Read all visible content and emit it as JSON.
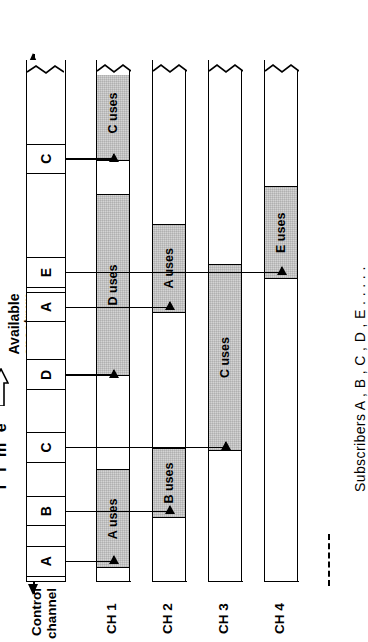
{
  "figure": {
    "axis_time_label": "T i m e",
    "axis_spectrum_label_line1": "Available",
    "axis_spectrum_label_line2": "spectrum",
    "subscribers_caption": "Subscribers A , B , C , D , E . . . . .",
    "time_arrow_icon": "hollow-up-arrow-icon",
    "spectrum_arrow_icon": "double-headed-arrow-icon"
  },
  "control_channel": {
    "label_line1": "Control",
    "label_line2": "channel",
    "slots": [
      {
        "id": "slot-a1",
        "label": "A",
        "start_pct": 0.8,
        "width_pct": 6.0
      },
      {
        "id": "slot-b",
        "label": "B",
        "start_pct": 10.6,
        "width_pct": 5.6
      },
      {
        "id": "slot-c1",
        "label": "C",
        "start_pct": 22.6,
        "width_pct": 6.0
      },
      {
        "id": "slot-d",
        "label": "D",
        "start_pct": 36.5,
        "width_pct": 6.0
      },
      {
        "id": "slot-a2",
        "label": "A",
        "start_pct": 49.6,
        "width_pct": 5.8
      },
      {
        "id": "slot-e",
        "label": "E",
        "start_pct": 56.2,
        "width_pct": 5.8
      },
      {
        "id": "slot-c2",
        "label": "C",
        "start_pct": 78.0,
        "width_pct": 5.8
      }
    ]
  },
  "channels": [
    {
      "id": "ch1",
      "label": "CH 1",
      "blocks": [
        {
          "id": "ch1-a",
          "label": "A uses",
          "start_pct": 2.6,
          "width_pct": 19.0
        },
        {
          "id": "ch1-d",
          "label": "D uses",
          "start_pct": 39.4,
          "width_pct": 35.0
        },
        {
          "id": "ch1-c",
          "label": "C uses",
          "start_pct": 80.6,
          "width_pct": 18.5
        }
      ]
    },
    {
      "id": "ch2",
      "label": "CH 2",
      "blocks": [
        {
          "id": "ch2-b",
          "label": "B uses",
          "start_pct": 12.2,
          "width_pct": 13.5
        },
        {
          "id": "ch2-a",
          "label": "A uses",
          "start_pct": 51.6,
          "width_pct": 17.0
        }
      ]
    },
    {
      "id": "ch3",
      "label": "CH 3",
      "blocks": [
        {
          "id": "ch3-c",
          "label": "C uses",
          "start_pct": 25.0,
          "width_pct": 36.0
        }
      ]
    },
    {
      "id": "ch4",
      "label": "CH 4",
      "blocks": [
        {
          "id": "ch4-e",
          "label": "E uses",
          "start_pct": 58.0,
          "width_pct": 17.8
        }
      ]
    }
  ],
  "allocations": [
    {
      "from_slot": "A",
      "to_channel": "CH 1"
    },
    {
      "from_slot": "B",
      "to_channel": "CH 2"
    },
    {
      "from_slot": "C",
      "to_channel": "CH 3"
    },
    {
      "from_slot": "D",
      "to_channel": "CH 1"
    },
    {
      "from_slot": "A",
      "to_channel": "CH 2"
    },
    {
      "from_slot": "E",
      "to_channel": "CH 4"
    },
    {
      "from_slot": "C",
      "to_channel": "CH 1"
    }
  ],
  "colors": {
    "line": "#000000",
    "block_fill": "#d4d4d4",
    "background": "#ffffff"
  }
}
